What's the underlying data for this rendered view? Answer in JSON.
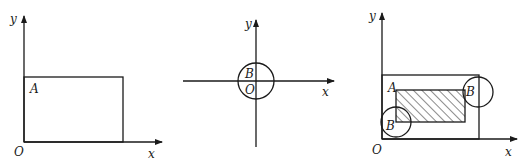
{
  "figures": [
    {
      "id": "panel-1",
      "description": "Rectangle region A in first quadrant",
      "labels": {
        "y": "y",
        "x": "x",
        "origin": "O",
        "region": "A"
      }
    },
    {
      "id": "panel-2",
      "description": "Circle region B centered at origin",
      "labels": {
        "y": "y",
        "x": "x",
        "origin": "O",
        "region": "B"
      }
    },
    {
      "id": "panel-3",
      "description": "Rectangle A with circle B at corners; hatched region of center positions",
      "labels": {
        "y": "y",
        "x": "x",
        "origin": "O",
        "region_a": "A",
        "region_b_top": "B",
        "region_b_bottom": "B"
      }
    }
  ],
  "colors": {
    "stroke": "#1a1a1a",
    "background": "#ffffff"
  }
}
